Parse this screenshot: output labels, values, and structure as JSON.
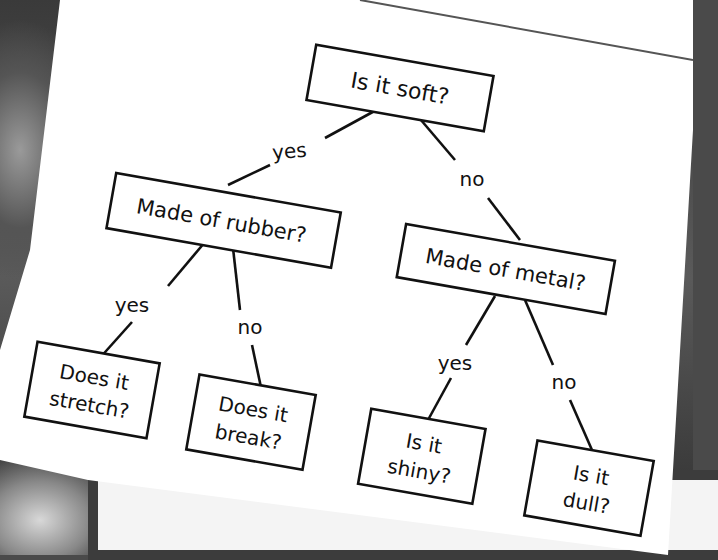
{
  "diagram": {
    "type": "decision-tree",
    "root": {
      "label": "Is it soft?"
    },
    "edges": {
      "root_yes": "yes",
      "root_no": "no",
      "rubber_yes": "yes",
      "rubber_no": "no",
      "metal_yes": "yes",
      "metal_no": "no"
    },
    "nodes": {
      "rubber": {
        "label": "Made of rubber?"
      },
      "metal": {
        "label": "Made of metal?"
      },
      "stretch": {
        "line1": "Does it",
        "line2": "stretch?"
      },
      "break": {
        "line1": "Does it",
        "line2": "break?"
      },
      "shiny": {
        "line1": "Is it",
        "line2": "shiny?"
      },
      "dull": {
        "line1": "Is it",
        "line2": "dull?"
      }
    }
  },
  "colors": {
    "ink": "#111111",
    "paper": "#ffffff",
    "background": "#4a4a4a"
  }
}
